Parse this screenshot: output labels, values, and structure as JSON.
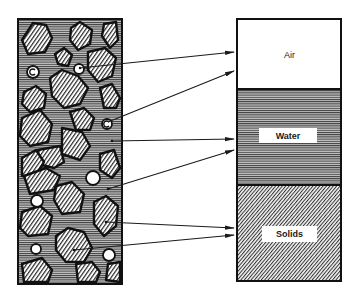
{
  "diagram": {
    "type": "soil-phase-diagram",
    "left_panel": {
      "description": "Soil cross-section with solid particles, water and air voids",
      "components": [
        "solid particles (diagonal hatching)",
        "water (horizontal lines)",
        "air voids (white circles)"
      ]
    },
    "right_panel": {
      "phases": [
        {
          "label": "Air",
          "fill": "white"
        },
        {
          "label": "Water",
          "fill": "horizontal-lines"
        },
        {
          "label": "Solids",
          "fill": "diagonal-hatch"
        }
      ]
    },
    "arrows": [
      {
        "from": "air-void",
        "to": "Air"
      },
      {
        "from": "air-void",
        "to": "Air"
      },
      {
        "from": "water",
        "to": "Water"
      },
      {
        "from": "water",
        "to": "Water"
      },
      {
        "from": "solid-particle",
        "to": "Solids"
      },
      {
        "from": "solid-particle",
        "to": "Solids"
      }
    ],
    "colors": {
      "ink": "#1a1a1a",
      "paper": "#ffffff",
      "water_bg": "#9a9a9a"
    }
  }
}
